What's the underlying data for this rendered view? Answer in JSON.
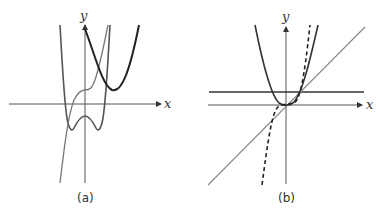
{
  "figure": {
    "panels": [
      {
        "id": "a",
        "caption": "(a)",
        "x_label": "x",
        "y_label": "y",
        "curves": [
          {
            "name": "quartic-w-shape",
            "style": "solid",
            "color": "#555555",
            "description": "W-shaped quartic with two local minima below x-axis and local max below origin"
          },
          {
            "name": "cubic-inflection",
            "style": "solid",
            "color": "#777777",
            "description": "Increasing cubic with flat inflection point above x-axis"
          },
          {
            "name": "shifted-parabola",
            "style": "solid",
            "color": "#222222",
            "description": "Upward parabola shifted right, vertex above x-axis"
          }
        ]
      },
      {
        "id": "b",
        "caption": "(b)",
        "x_label": "x",
        "y_label": "y",
        "curves": [
          {
            "name": "parabola",
            "style": "solid",
            "color": "#333333",
            "description": "y = x^2 through origin"
          },
          {
            "name": "cubic",
            "style": "dashed",
            "color": "#222222",
            "description": "y = x^3 through origin"
          },
          {
            "name": "line-y-eq-x",
            "style": "solid",
            "color": "#888888",
            "description": "y = x diagonal line"
          },
          {
            "name": "horizontal-line",
            "style": "solid",
            "color": "#333333",
            "description": "y = 1 horizontal line"
          }
        ]
      }
    ]
  }
}
